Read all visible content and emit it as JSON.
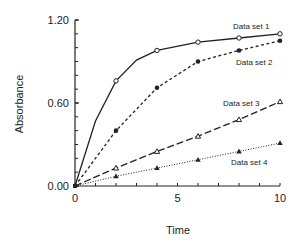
{
  "chart_data": {
    "type": "line",
    "title": "",
    "xlabel": "Time",
    "ylabel": "Absorbance",
    "xlim": [
      0,
      10
    ],
    "ylim": [
      0.0,
      1.2
    ],
    "x_ticks": [
      0,
      5,
      10
    ],
    "x_tick_labels": [
      "0",
      "5",
      "10"
    ],
    "x_minor_step": 1,
    "y_ticks": [
      0.0,
      0.6,
      1.2
    ],
    "y_tick_labels": [
      "0.00",
      "0.60",
      "1.20"
    ],
    "y_minor_step": 0.1,
    "grid": false,
    "legend": "inline labels near line ends",
    "series": [
      {
        "name": "Data set 1",
        "line_style": "solid",
        "marker": "open-circle",
        "line_x": [
          0,
          1,
          2,
          3,
          4,
          6,
          8,
          10
        ],
        "line_y": [
          0.0,
          0.47,
          0.76,
          0.91,
          0.98,
          1.04,
          1.07,
          1.1
        ],
        "x": [
          0,
          2,
          4,
          6,
          8,
          10
        ],
        "y": [
          0.0,
          0.76,
          0.98,
          1.04,
          1.07,
          1.1
        ],
        "label_pos": [
          233,
          29
        ]
      },
      {
        "name": "Data set 2",
        "line_style": "dashed",
        "marker": "filled-circle",
        "line_x": [
          0,
          2,
          4,
          6,
          8,
          10
        ],
        "line_y": [
          0.0,
          0.4,
          0.71,
          0.9,
          0.98,
          1.05
        ],
        "x": [
          0,
          2,
          4,
          6,
          8,
          10
        ],
        "y": [
          0.0,
          0.4,
          0.71,
          0.9,
          0.98,
          1.05
        ],
        "label_pos": [
          236,
          65
        ]
      },
      {
        "name": "Data set 3",
        "line_style": "long-dash",
        "marker": "open-triangle",
        "line_x": [
          0,
          2,
          4,
          6,
          8,
          10
        ],
        "line_y": [
          0.0,
          0.13,
          0.25,
          0.36,
          0.48,
          0.61
        ],
        "x": [
          0,
          2,
          4,
          6,
          8,
          10
        ],
        "y": [
          0.0,
          0.13,
          0.25,
          0.36,
          0.48,
          0.61
        ],
        "label_pos": [
          223,
          106
        ]
      },
      {
        "name": "Data set 4",
        "line_style": "dotted",
        "marker": "filled-triangle",
        "line_x": [
          0,
          2,
          4,
          6,
          8,
          10
        ],
        "line_y": [
          0.0,
          0.07,
          0.13,
          0.19,
          0.25,
          0.31
        ],
        "x": [
          0,
          2,
          4,
          6,
          8,
          10
        ],
        "y": [
          0.0,
          0.07,
          0.13,
          0.19,
          0.25,
          0.31
        ],
        "label_pos": [
          231,
          165
        ]
      }
    ]
  },
  "colors": {
    "ink": "#222222",
    "background": "#ffffff"
  }
}
